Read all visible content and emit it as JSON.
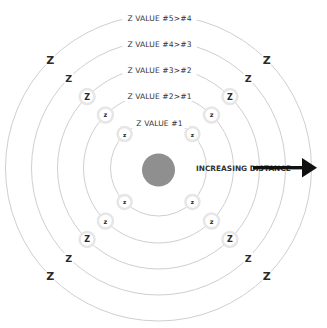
{
  "diagram": {
    "center": {
      "x": 158.5,
      "y": 168,
      "blob_radius": 16.5,
      "blob_color": "#8f8f8f"
    },
    "rings": [
      {
        "radius": 48,
        "label": "Z VALUE #1",
        "marker_size": 5.5,
        "halo_radius": 7
      },
      {
        "radius": 75,
        "label": "Z VALUE #2>#1",
        "marker_size": 6.5,
        "halo_radius": 7.5
      },
      {
        "radius": 101,
        "label": "Z VALUE #3>#2",
        "marker_size": 8,
        "halo_radius": 7.5
      },
      {
        "radius": 127,
        "label": "Z VALUE #4>#3",
        "marker_size": 9.5,
        "halo_radius": 0
      },
      {
        "radius": 153,
        "label": "Z VALUE #5>#4",
        "marker_size": 11,
        "halo_radius": 0
      }
    ],
    "marker_glyph": "z",
    "marker_glyph_large": "Z",
    "arrow": {
      "label": "INCREASING DISTANCE",
      "color": "#111111"
    },
    "ring_color": "#cfcfcf"
  }
}
